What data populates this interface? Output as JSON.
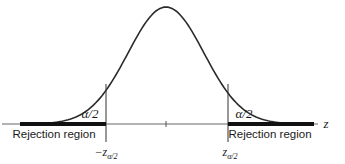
{
  "figure": {
    "type": "standard-normal-two-tailed-rejection-region",
    "curve": "standard normal density (bell curve)",
    "axis_label": "z",
    "tail_area_label_left": "α/2",
    "tail_area_label_right": "α/2",
    "rejection_region_left": "Rejection region",
    "rejection_region_right": "Rejection region",
    "critical_value_left": {
      "sign": "−",
      "symbol": "z",
      "subscript": "α/2"
    },
    "critical_value_right": {
      "symbol": "z",
      "subscript": "α/2"
    },
    "center_tick": "0",
    "colors": {
      "curve": "#2a2a2a",
      "axis": "#555555",
      "rejection_bar": "#111111",
      "background": "#ffffff"
    }
  }
}
